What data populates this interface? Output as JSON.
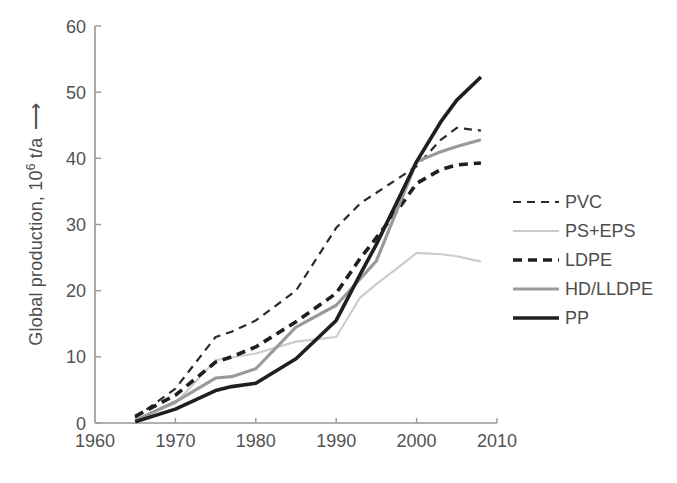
{
  "figure": {
    "background": "#ffffff",
    "text_color": "#525252",
    "axis_color": "#979797"
  },
  "ylabel": {
    "prefix": "Global production, 10",
    "superscript": "6",
    "suffix": " t/a",
    "arrow": "⟶"
  },
  "chart_data": {
    "type": "line",
    "title": "",
    "xlabel": "",
    "ylabel": "Global production, 10^6 t/a",
    "xlim": [
      1960,
      2010
    ],
    "ylim": [
      0,
      60
    ],
    "xticks": [
      1960,
      1970,
      1980,
      1990,
      2000,
      2010
    ],
    "yticks": [
      0,
      10,
      20,
      30,
      40,
      50,
      60
    ],
    "grid": false,
    "legend_position": "right",
    "x": [
      1965,
      1970,
      1975,
      1977,
      1980,
      1985,
      1990,
      1993,
      1995,
      1998,
      2000,
      2003,
      2005,
      2008
    ],
    "series": [
      {
        "name": "PVC",
        "color": "#2b2b2b",
        "width": 2.2,
        "dash": "8 6",
        "values": [
          0.8,
          5.2,
          13.0,
          13.8,
          15.5,
          20.0,
          29.5,
          33.2,
          34.8,
          37.2,
          38.8,
          42.8,
          44.6,
          44.2
        ]
      },
      {
        "name": "PS+EPS",
        "color": "#cccccc",
        "width": 2.2,
        "dash": "",
        "values": [
          0.5,
          3.0,
          9.5,
          9.9,
          10.5,
          12.3,
          13.0,
          19.0,
          21.0,
          23.8,
          25.7,
          25.5,
          25.2,
          24.4
        ]
      },
      {
        "name": "LDPE",
        "color": "#1f1f1f",
        "width": 3.6,
        "dash": "9 6",
        "values": [
          1.0,
          4.2,
          9.2,
          10.0,
          11.5,
          15.3,
          19.6,
          24.9,
          28.0,
          32.8,
          36.2,
          38.3,
          39.0,
          39.3
        ]
      },
      {
        "name": "HD/LLDPE",
        "color": "#9a9a9a",
        "width": 3.2,
        "dash": "",
        "values": [
          0.4,
          3.2,
          6.8,
          7.0,
          8.2,
          14.5,
          17.8,
          21.8,
          24.5,
          33.5,
          39.5,
          41.0,
          41.8,
          42.8
        ]
      },
      {
        "name": "PP",
        "color": "#1f1f1f",
        "width": 3.6,
        "dash": "",
        "values": [
          0.2,
          2.1,
          4.9,
          5.5,
          6.0,
          9.7,
          15.5,
          22.5,
          27.0,
          34.5,
          39.5,
          45.5,
          48.8,
          52.3
        ]
      }
    ]
  }
}
